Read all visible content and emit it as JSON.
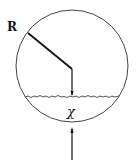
{
  "diagram": {
    "labels": {
      "radius": "R",
      "chi": "χ"
    },
    "colors": {
      "stroke": "#222222",
      "background": "#ffffff"
    }
  }
}
